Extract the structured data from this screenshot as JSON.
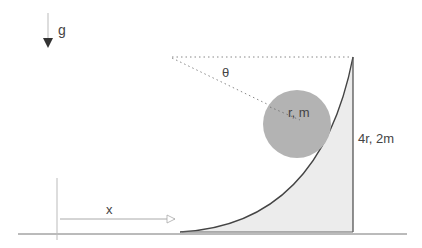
{
  "labels": {
    "gravity": "g",
    "angle": "θ",
    "ball": "r, m",
    "block": "4r, 2m",
    "displacement": "x"
  },
  "colors": {
    "ball_fill": "#b3b3b3",
    "wedge_fill": "#ececec",
    "line": "#555555",
    "light_line": "#9a9a9a"
  }
}
